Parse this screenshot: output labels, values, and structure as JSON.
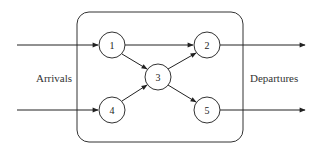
{
  "diagram": {
    "type": "network-flow",
    "colors": {
      "stroke": "#222222",
      "text": "#333333",
      "background": "#ffffff"
    },
    "labels": {
      "left": "Arrivals",
      "right": "Departures"
    },
    "nodes": [
      {
        "id": "1",
        "label": "1"
      },
      {
        "id": "2",
        "label": "2"
      },
      {
        "id": "3",
        "label": "3"
      },
      {
        "id": "4",
        "label": "4"
      },
      {
        "id": "5",
        "label": "5"
      }
    ],
    "edges": [
      {
        "from": "arrival-top",
        "to": "1"
      },
      {
        "from": "arrival-bottom",
        "to": "4"
      },
      {
        "from": "1",
        "to": "2"
      },
      {
        "from": "1",
        "to": "3"
      },
      {
        "from": "4",
        "to": "3"
      },
      {
        "from": "3",
        "to": "2"
      },
      {
        "from": "3",
        "to": "5"
      },
      {
        "from": "2",
        "to": "departure-top"
      },
      {
        "from": "5",
        "to": "departure-bottom"
      }
    ]
  }
}
